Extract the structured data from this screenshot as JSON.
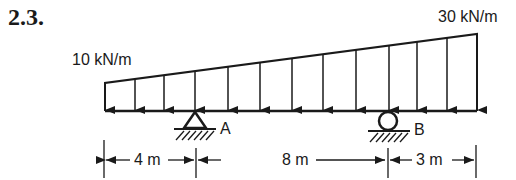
{
  "problem_number": "2.3.",
  "loads": {
    "left_intensity": "10 kN/m",
    "right_intensity": "30 kN/m",
    "arrow_x": [
      105,
      135,
      164,
      195,
      228,
      260,
      292,
      323,
      356,
      389,
      417,
      447,
      477
    ]
  },
  "supports": {
    "A": {
      "label": "A",
      "type": "pin"
    },
    "B": {
      "label": "B",
      "type": "roller"
    }
  },
  "dimensions": {
    "left_overhang": "4 m",
    "span": "8 m",
    "right_overhang": "3 m"
  }
}
